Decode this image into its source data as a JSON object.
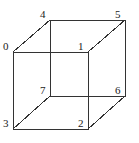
{
  "figure": {
    "name": "numbered-cube-wireframe",
    "width": 139,
    "height": 143,
    "background_color": "#ffffff",
    "line_color": "#333333",
    "line_width": 1,
    "label_color": "#1a1a1a",
    "label_font_size": 11
  },
  "vertices": [
    {
      "label": "0",
      "x": 13,
      "y": 52,
      "label_x": 3,
      "label_y": 41,
      "face": "front"
    },
    {
      "label": "1",
      "x": 88,
      "y": 52,
      "label_x": 78,
      "label_y": 41,
      "face": "front"
    },
    {
      "label": "2",
      "x": 88,
      "y": 129,
      "label_x": 78,
      "label_y": 118,
      "face": "front"
    },
    {
      "label": "3",
      "x": 13,
      "y": 129,
      "label_x": 3,
      "label_y": 118,
      "face": "front"
    },
    {
      "label": "4",
      "x": 50,
      "y": 20,
      "label_x": 40,
      "label_y": 9,
      "face": "back"
    },
    {
      "label": "5",
      "x": 125,
      "y": 20,
      "label_x": 115,
      "label_y": 9,
      "face": "back"
    },
    {
      "label": "6",
      "x": 125,
      "y": 96,
      "label_x": 115,
      "label_y": 85,
      "face": "back"
    },
    {
      "label": "7",
      "x": 50,
      "y": 96,
      "label_x": 40,
      "label_y": 85,
      "face": "back"
    }
  ],
  "edges": [
    {
      "name": "edge-0-1",
      "from": "0",
      "x1": 13,
      "y1": 52,
      "x2": 88,
      "y2": 52
    },
    {
      "name": "edge-1-2",
      "from": "1",
      "x1": 88,
      "y1": 52,
      "x2": 88,
      "y2": 129
    },
    {
      "name": "edge-2-3",
      "from": "2",
      "x1": 88,
      "y1": 129,
      "x2": 13,
      "y2": 129
    },
    {
      "name": "edge-3-0",
      "from": "3",
      "x1": 13,
      "y1": 129,
      "x2": 13,
      "y2": 52
    },
    {
      "name": "edge-4-5",
      "from": "4",
      "x1": 50,
      "y1": 20,
      "x2": 125,
      "y2": 20
    },
    {
      "name": "edge-5-6",
      "from": "5",
      "x1": 125,
      "y1": 20,
      "x2": 125,
      "y2": 96
    },
    {
      "name": "edge-6-7",
      "from": "6",
      "x1": 125,
      "y1": 96,
      "x2": 50,
      "y2": 96
    },
    {
      "name": "edge-7-4",
      "from": "7",
      "x1": 50,
      "y1": 96,
      "x2": 50,
      "y2": 20
    },
    {
      "name": "edge-0-4",
      "from": "0",
      "x1": 13,
      "y1": 52,
      "x2": 50,
      "y2": 20
    },
    {
      "name": "edge-1-5",
      "from": "1",
      "x1": 88,
      "y1": 52,
      "x2": 125,
      "y2": 20
    },
    {
      "name": "edge-2-6",
      "from": "2",
      "x1": 88,
      "y1": 129,
      "x2": 125,
      "y2": 96
    },
    {
      "name": "edge-3-7",
      "from": "3",
      "x1": 13,
      "y1": 129,
      "x2": 50,
      "y2": 96
    }
  ]
}
